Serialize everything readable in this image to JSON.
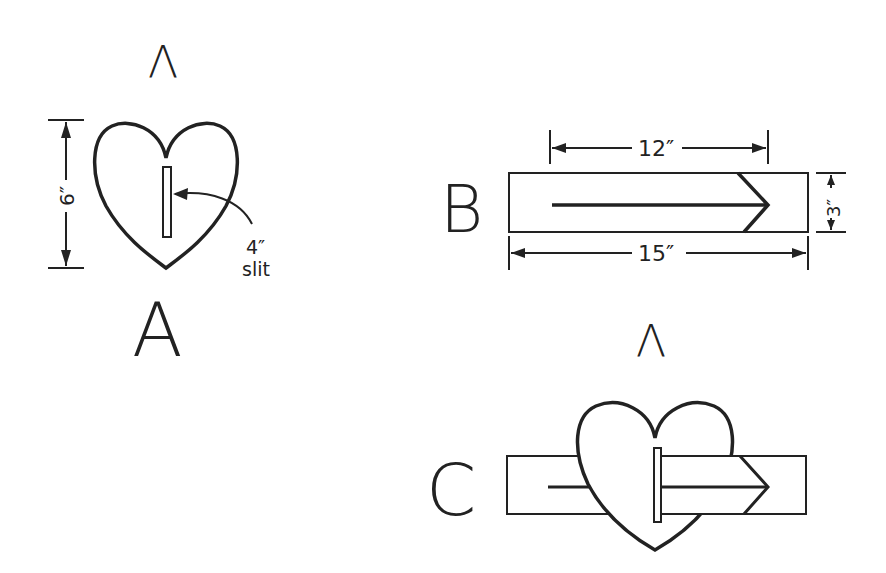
{
  "figure": {
    "type": "craft instruction diagram",
    "panels": [
      {
        "id": "A",
        "label": "A",
        "description": "Heart shape with vertical slit",
        "dimensions": {
          "height_label": "6″",
          "slit_label_size": "4″",
          "slit_label_word": "slit"
        }
      },
      {
        "id": "B",
        "label": "B",
        "description": "Rectangular strip with arrow drawn on it",
        "dimensions": {
          "arrow_length_label": "12″",
          "strip_length_label": "15″",
          "strip_height_label": "3″"
        }
      },
      {
        "id": "C",
        "label": "C",
        "description": "Strip with arrow threaded through the heart's slit"
      }
    ],
    "stray_marks": [
      "Λ",
      "Λ"
    ],
    "colors": {
      "ink": "#222222",
      "background": "#ffffff"
    }
  }
}
